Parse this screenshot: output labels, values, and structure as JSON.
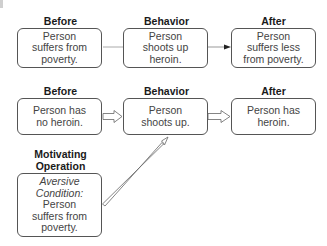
{
  "diagram": {
    "top_row": {
      "headers": [
        "Before",
        "Behavior",
        "After"
      ],
      "boxes": [
        {
          "lines": [
            "Person",
            "suffers from",
            "poverty."
          ]
        },
        {
          "lines": [
            "Person",
            "shoots up",
            "heroin."
          ]
        },
        {
          "lines": [
            "Person",
            "suffers less",
            "from poverty."
          ]
        }
      ]
    },
    "bottom_row": {
      "headers": [
        "Before",
        "Behavior",
        "After"
      ],
      "boxes": [
        {
          "lines": [
            "Person has",
            "no heroin."
          ]
        },
        {
          "lines": [
            "Person",
            "shoots up."
          ]
        },
        {
          "lines": [
            "Person has",
            "heroin."
          ]
        }
      ]
    },
    "motivating_operation": {
      "header_lines": [
        "Motivating",
        "Operation"
      ],
      "italic_lines": [
        "Aversive",
        "Condition:"
      ],
      "lines": [
        "Person",
        "suffers from",
        "poverty."
      ]
    },
    "colors": {
      "box_border": "#555555",
      "text": "#444444",
      "header": "#1a1a1a",
      "arrow": "#777777"
    }
  }
}
